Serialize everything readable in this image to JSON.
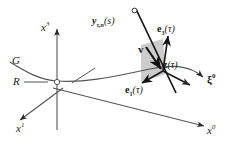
{
  "figure": {
    "background_color": "#ffffff",
    "ink_color": "#1a1a1a",
    "plane_fill": "#c9c9c9",
    "axes": [
      {
        "name": "x3-axis",
        "label_main": "x",
        "label_sup": "3"
      },
      {
        "name": "x1-axis",
        "label_main": "x",
        "label_sup": "1"
      },
      {
        "name": "x0-axis",
        "label_main": "x",
        "label_sup": "0"
      }
    ],
    "labels": {
      "x3": {
        "main": "x",
        "sup": "3"
      },
      "x1": {
        "main": "x",
        "sup": "1"
      },
      "x0": {
        "main": "x",
        "sup": "0"
      },
      "xi0": {
        "main": "ξ",
        "sup": "0"
      },
      "G": "G",
      "R": "R",
      "y_curve": {
        "main": "y",
        "sub": "τ,n",
        "arg": "(s)"
      },
      "e3": {
        "main": "e",
        "sub": "3",
        "arg": "(τ)"
      },
      "e1": {
        "main": "e",
        "sub": "1",
        "arg": "(τ)"
      },
      "z": {
        "main": "z",
        "arg": "(τ)"
      },
      "v": "v"
    },
    "elements": [
      {
        "name": "worldline-curve-G",
        "kind": "curve"
      },
      {
        "name": "reference-frame-R-leader",
        "kind": "leader-line"
      },
      {
        "name": "shaded-plane",
        "kind": "polygon"
      },
      {
        "name": "geodesic-line-y",
        "kind": "line"
      },
      {
        "name": "origin-marker",
        "kind": "open-circle"
      },
      {
        "name": "endpoint-marker",
        "kind": "open-circle"
      }
    ]
  }
}
